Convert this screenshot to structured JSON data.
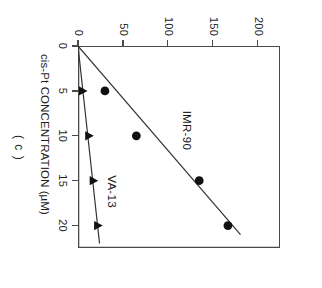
{
  "panel": {
    "label": "( c )"
  },
  "axes": {
    "x": {
      "title": "cis-Pt CONCENTRATION (µM)",
      "ticks": [
        0,
        5,
        10,
        15,
        20
      ],
      "tick_labels": [
        "0",
        "5",
        "10",
        "15",
        "20"
      ],
      "min": 0,
      "max": 22.5
    },
    "y": {
      "title": "(Rad Equivalents)",
      "ticks": [
        0,
        50,
        100,
        150,
        200
      ],
      "tick_labels": [
        "0",
        "50",
        "100",
        "150",
        "200"
      ],
      "min": 0,
      "max": 225
    }
  },
  "series_labels": {
    "imr90": "IMR-90",
    "va13": "VA-13"
  },
  "colors": {
    "marker": "#111111",
    "line": "#333333",
    "axis": "#4a4a4a",
    "background": "#ffffff"
  },
  "chart_data": {
    "type": "scatter",
    "title": "",
    "subtitle": "",
    "panel_label": "( c )",
    "xlabel": "cis-Pt CONCENTRATION (µM)",
    "ylabel": "(Rad Equivalents)",
    "xlim": [
      0,
      22.5
    ],
    "ylim": [
      0,
      225
    ],
    "xticks": [
      0,
      5,
      10,
      15,
      20
    ],
    "yticks": [
      0,
      50,
      100,
      150,
      200
    ],
    "grid": false,
    "legend": "inline-annotations",
    "rotation_note": "figure printed rotated 90 degrees clockwise",
    "series": [
      {
        "name": "IMR-90",
        "marker": "filled-circle",
        "points": [
          {
            "x": 5,
            "y": 30
          },
          {
            "x": 10,
            "y": 65
          },
          {
            "x": 15,
            "y": 135
          },
          {
            "x": 20,
            "y": 167
          }
        ],
        "fit_line": {
          "through_origin": true,
          "slope": 8.6,
          "x_end": 21.0,
          "y_end": 181
        }
      },
      {
        "name": "VA-13",
        "marker": "filled-triangle",
        "points": [
          {
            "x": 5,
            "y": 5
          },
          {
            "x": 10,
            "y": 12
          },
          {
            "x": 15,
            "y": 17
          },
          {
            "x": 20,
            "y": 22
          }
        ],
        "fit_line": {
          "through_origin": true,
          "slope": 1.1,
          "x_end": 22.0,
          "y_end": 24
        }
      }
    ]
  }
}
